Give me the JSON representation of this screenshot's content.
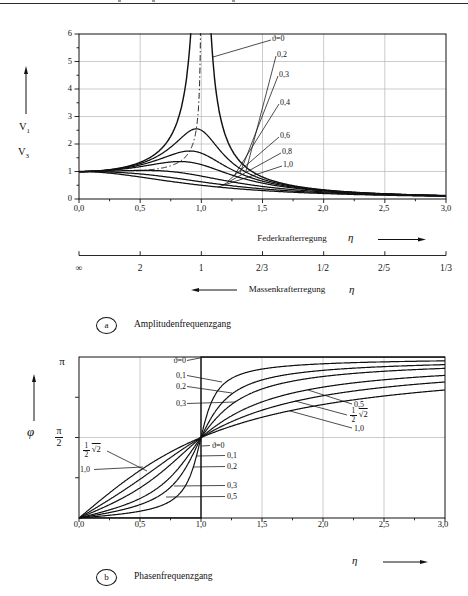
{
  "figure": {
    "captions": {
      "a": {
        "id": "a",
        "text": "Amplitudenfrequenzgang"
      },
      "b": {
        "id": "b",
        "text": "Phasenfrequenzgang"
      }
    }
  },
  "amplitude_chart": {
    "v1": {
      "base": "V",
      "sub": "1"
    },
    "v3": {
      "base": "V",
      "sub": "3"
    },
    "y_ticks": [
      "6",
      "5",
      "4",
      "3",
      "2",
      "1",
      "0"
    ],
    "x_ticks": [
      "0,0",
      "0,5",
      "1,0",
      "1,5",
      "2,0",
      "2,5",
      "3,0"
    ],
    "x_caption": "Federkrafterregung",
    "x_symbol": "η",
    "curve_labels": [
      "ϑ=0",
      "0,2",
      "0,3",
      "0,4",
      "0,6",
      "0,8",
      "1,0"
    ]
  },
  "reciprocal_scale": {
    "ticks": [
      "∞",
      "2",
      "1",
      "2/3",
      "1/2",
      "2/5",
      "1/3"
    ],
    "caption": "Massenkrafterregung",
    "symbol": "η"
  },
  "phase_chart": {
    "y_top": "π",
    "y_mid": {
      "num": "π",
      "den": "2"
    },
    "y_symbol": "φ",
    "x_ticks": [
      "0,0",
      "0,5",
      "1,0",
      "1,5",
      "2,0",
      "2,5",
      "3,0"
    ],
    "x_symbol": "η",
    "labels_upper_left": [
      "ϑ=0",
      "0,1",
      "0,2",
      "0,3"
    ],
    "inner_frac": {
      "num": "1",
      "den": "2"
    },
    "inner_root": "√2",
    "inner_one": "1,0",
    "labels_right_of_eta1": [
      "ϑ=0",
      "0,1",
      "0,2",
      "0,3",
      "0,5"
    ],
    "rs_top": "0,5",
    "rs_frac": {
      "num": "1",
      "den": "2"
    },
    "rs_root": "√2",
    "rs_bottom": "1,0"
  },
  "chart_data": [
    {
      "id": "a",
      "type": "line",
      "title": "Amplitudenfrequenzgang",
      "xlabel": "η — obere Skala: Federkrafterregung; untere Skala (1/η): Massenkrafterregung",
      "ylabel": "V1, V3",
      "xlim": [
        0,
        3
      ],
      "ylim": [
        0,
        6
      ],
      "x_ticks": [
        0,
        0.5,
        1,
        1.5,
        2,
        2.5,
        3
      ],
      "y_ticks": [
        0,
        1,
        2,
        3,
        4,
        5,
        6
      ],
      "grid": true,
      "formula": "V(η) = 1 / sqrt((1-η²)² + 4ϑ²η²)",
      "x_sample": [
        0,
        0.5,
        1,
        1.5,
        2,
        2.5,
        3
      ],
      "series": [
        {
          "name": "ϑ=0",
          "damping": 0,
          "values": [
            1,
            1.333,
            null,
            0.8,
            0.333,
            0.19,
            0.125
          ]
        },
        {
          "name": "0,2",
          "damping": 0.2,
          "values": [
            1,
            1.288,
            2.5,
            0.721,
            0.322,
            0.187,
            0.124
          ]
        },
        {
          "name": "0,3",
          "damping": 0.3,
          "values": [
            1,
            1.238,
            1.667,
            0.649,
            0.31,
            0.183,
            0.122
          ]
        },
        {
          "name": "0,4",
          "damping": 0.4,
          "values": [
            1,
            1.176,
            1.25,
            0.577,
            0.294,
            0.178,
            0.12
          ]
        },
        {
          "name": "0,6",
          "damping": 0.6,
          "values": [
            1,
            1.041,
            0.833,
            0.456,
            0.26,
            0.165,
            0.114
          ]
        },
        {
          "name": "0,8",
          "damping": 0.8,
          "values": [
            1,
            0.912,
            0.625,
            0.37,
            0.228,
            0.152,
            0.107
          ]
        },
        {
          "name": "1,0",
          "damping": 1,
          "values": [
            1,
            0.8,
            0.5,
            0.308,
            0.2,
            0.138,
            0.1
          ]
        }
      ],
      "annotations": {
        "dash_dot_curve": "Ortskurve der Maxima: η=√(1-2ϑ²), V=1/(2ϑ√(1-ϑ²))"
      },
      "second_scale": {
        "label": "Massenkrafterregung",
        "tick_values": [
          "∞",
          "2",
          "1",
          "2/3",
          "1/2",
          "2/5",
          "1/3"
        ]
      },
      "legend_position": "right-inside-as-leader-labels"
    },
    {
      "id": "b",
      "type": "line",
      "title": "Phasenfrequenzgang",
      "xlabel": "η",
      "ylabel": "φ (0 … π)",
      "xlim": [
        0,
        3
      ],
      "ylim_pi": [
        0,
        1
      ],
      "x_ticks": [
        0,
        0.5,
        1,
        1.5,
        2,
        2.5,
        3
      ],
      "y_ticks_pi": [
        0,
        0.5,
        1
      ],
      "formula": "φ(η) = atan2(2ϑη, 1-η²)",
      "values_unit": "φ/π",
      "x_sample": [
        0,
        0.5,
        1,
        1.5,
        2,
        2.5,
        3
      ],
      "series": [
        {
          "name": "ϑ=0",
          "damping": 0,
          "values": [
            0,
            0,
            0.5,
            1,
            1,
            1,
            1
          ]
        },
        {
          "name": "0,1",
          "damping": 0.1,
          "values": [
            0,
            0.042,
            0.5,
            0.925,
            0.958,
            0.97,
            0.976
          ]
        },
        {
          "name": "0,2",
          "damping": 0.2,
          "values": [
            0,
            0.083,
            0.5,
            0.858,
            0.917,
            0.94,
            0.953
          ]
        },
        {
          "name": "0,3",
          "damping": 0.3,
          "values": [
            0,
            0.121,
            0.5,
            0.801,
            0.879,
            0.911,
            0.93
          ]
        },
        {
          "name": "0,5",
          "damping": 0.5,
          "values": [
            0,
            0.187,
            0.5,
            0.721,
            0.813,
            0.859,
            0.886
          ]
        },
        {
          "name": "½√2",
          "damping": 0.7071,
          "values": [
            0,
            0.241,
            0.5,
            0.67,
            0.759,
            0.811,
            0.845
          ]
        },
        {
          "name": "1,0",
          "damping": 1,
          "values": [
            0,
            0.295,
            0.5,
            0.626,
            0.705,
            0.758,
            0.795
          ]
        }
      ],
      "crossing_point": {
        "eta": 1,
        "phi": "π/2"
      }
    }
  ]
}
